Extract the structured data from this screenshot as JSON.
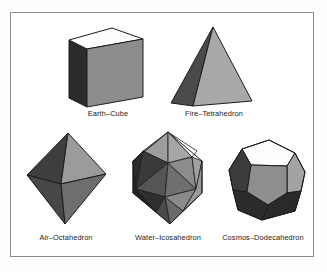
{
  "figure": {
    "background_color": "#ffffff",
    "frame_border_color": "#8a8a8a",
    "solids": [
      {
        "id": "cube",
        "label": "Earth–Cube",
        "element": "Earth",
        "shape": "Cube",
        "faces_visible": 3,
        "face_colors": {
          "top": "#fdfdfd",
          "left": "#2b2b2b",
          "front": "#8d8d8d"
        },
        "edge_color": "#1c1c1c"
      },
      {
        "id": "tetrahedron",
        "label": "Fire–Tetrahedron",
        "element": "Fire",
        "shape": "Tetrahedron",
        "faces_visible": 2,
        "face_colors": {
          "left": "#4a4a4a",
          "right": "#a8a8a8"
        },
        "edge_color": "#1c1c1c"
      },
      {
        "id": "octahedron",
        "label": "Air–Octahedron",
        "element": "Air",
        "shape": "Octahedron",
        "faces_visible": 4,
        "face_colors": {
          "upper_left": "#3e3e3e",
          "upper_right": "#9b9b9b",
          "lower_left": "#474747",
          "lower_right": "#6e6e6e"
        },
        "edge_color": "#1c1c1c"
      },
      {
        "id": "icosahedron",
        "label": "Water–Icosahedron",
        "element": "Water",
        "shape": "Icosahedron",
        "faces_visible": 10,
        "face_colors": {
          "highlight": "#ffffff",
          "light": "#a6a6a6",
          "mid": "#6f6f6f",
          "dark": "#3a3a3a",
          "darkest": "#262626"
        },
        "edge_color": "#1c1c1c"
      },
      {
        "id": "dodecahedron",
        "label": "Cosmos–Dodecahedron",
        "element": "Cosmos",
        "shape": "Dodecahedron",
        "faces_visible": 6,
        "face_colors": {
          "top": "#fdfdfd",
          "front": "#8e8e8e",
          "upper_right": "#a3a3a3",
          "left": "#3c3c3c",
          "lower_left": "#2c2c2c",
          "lower_right": "#2a2a2a"
        },
        "edge_color": "#1c1c1c"
      }
    ]
  }
}
